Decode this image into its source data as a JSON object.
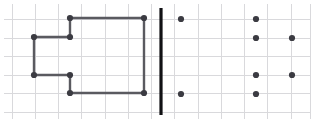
{
  "figure": {
    "canvas": {
      "width": 314,
      "height": 125,
      "background": "#ffffff"
    },
    "grid": {
      "line_color": "#d9d9dc",
      "x_positions": [
        12,
        35,
        58,
        81,
        105,
        128,
        151,
        174,
        198,
        221,
        244,
        267,
        291,
        310
      ],
      "y_positions": [
        19,
        38,
        56,
        75,
        93,
        112
      ],
      "cell_width": 23,
      "cell_height": 18.5
    },
    "divider": {
      "label": "vertical-separator-bar",
      "color": "#111114",
      "x": 161,
      "y_start": 8,
      "y_end": 115,
      "thickness": 3.2
    },
    "style": {
      "node_color": "#3b3b42",
      "node_radius": 3.1,
      "edge_color": "#5a5a60",
      "edge_width": 2.4
    },
    "left_shape": {
      "label": "connected-rectilinear-outline",
      "nodes": [
        {
          "id": "n1",
          "x": 34,
          "y": 37
        },
        {
          "id": "n2",
          "x": 70,
          "y": 37
        },
        {
          "id": "n3",
          "x": 70,
          "y": 18
        },
        {
          "id": "n4",
          "x": 144,
          "y": 18
        },
        {
          "id": "n5",
          "x": 144,
          "y": 93
        },
        {
          "id": "n6",
          "x": 70,
          "y": 93
        },
        {
          "id": "n7",
          "x": 70,
          "y": 75
        },
        {
          "id": "n8",
          "x": 34,
          "y": 75
        }
      ],
      "edges": [
        {
          "from": "n1",
          "to": "n2"
        },
        {
          "from": "n2",
          "to": "n3"
        },
        {
          "from": "n3",
          "to": "n4"
        },
        {
          "from": "n4",
          "to": "n5"
        },
        {
          "from": "n5",
          "to": "n6"
        },
        {
          "from": "n6",
          "to": "n7"
        },
        {
          "from": "n7",
          "to": "n8"
        },
        {
          "from": "n8",
          "to": "n1"
        }
      ]
    },
    "right_points": {
      "label": "scattered-dot-set",
      "nodes": [
        {
          "id": "p1",
          "x": 181,
          "y": 19
        },
        {
          "id": "p2",
          "x": 181,
          "y": 94
        },
        {
          "id": "p3",
          "x": 256,
          "y": 19
        },
        {
          "id": "p4",
          "x": 256,
          "y": 38
        },
        {
          "id": "p5",
          "x": 256,
          "y": 75
        },
        {
          "id": "p6",
          "x": 256,
          "y": 94
        },
        {
          "id": "p7",
          "x": 292,
          "y": 38
        },
        {
          "id": "p8",
          "x": 292,
          "y": 75
        }
      ]
    }
  }
}
